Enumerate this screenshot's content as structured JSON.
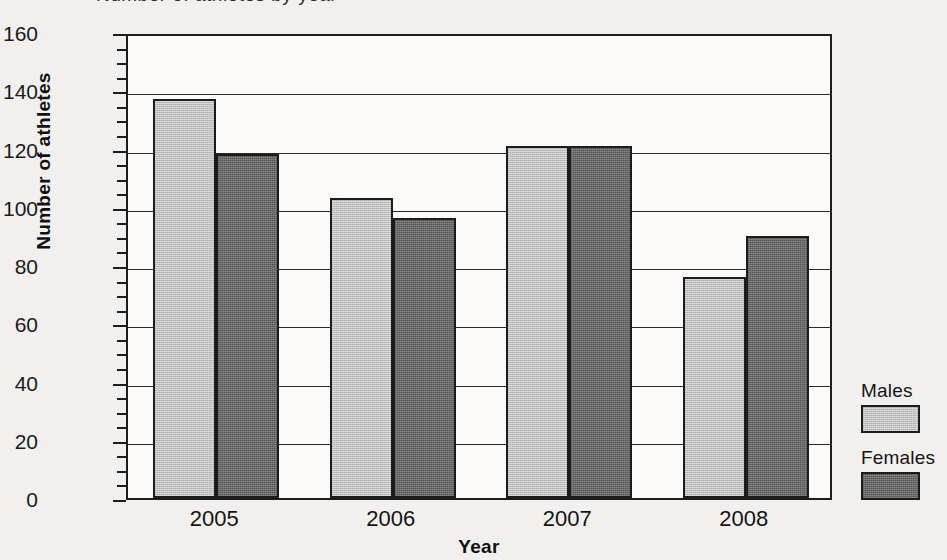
{
  "clipped_header_text": "Number of athletes by year",
  "chart_data": {
    "type": "bar",
    "title": "",
    "xlabel": "Year",
    "ylabel": "Number of athletes",
    "categories": [
      "2005",
      "2006",
      "2007",
      "2008"
    ],
    "series": [
      {
        "name": "Males",
        "color": "#b9b9b9",
        "values": [
          137,
          103,
          121,
          76
        ]
      },
      {
        "name": "Females",
        "color": "#636363",
        "values": [
          118,
          96,
          121,
          90
        ]
      }
    ],
    "ylim": [
      0,
      160
    ],
    "ytick_labels": [
      "0",
      "20",
      "40",
      "60",
      "80",
      "100",
      "120",
      "140",
      "160"
    ],
    "ytick_values": [
      0,
      20,
      40,
      60,
      80,
      100,
      120,
      140,
      160
    ],
    "yminor_step": 5,
    "grid": true,
    "legend_position": "right-outside",
    "bar_outline_color": "#1c1c1c",
    "axis_color": "#1d1d1d",
    "plot_background": "#fbfaf9",
    "page_background": "#f2f0ee"
  },
  "legend": {
    "entries": [
      {
        "label": "Males"
      },
      {
        "label": "Females"
      }
    ]
  }
}
